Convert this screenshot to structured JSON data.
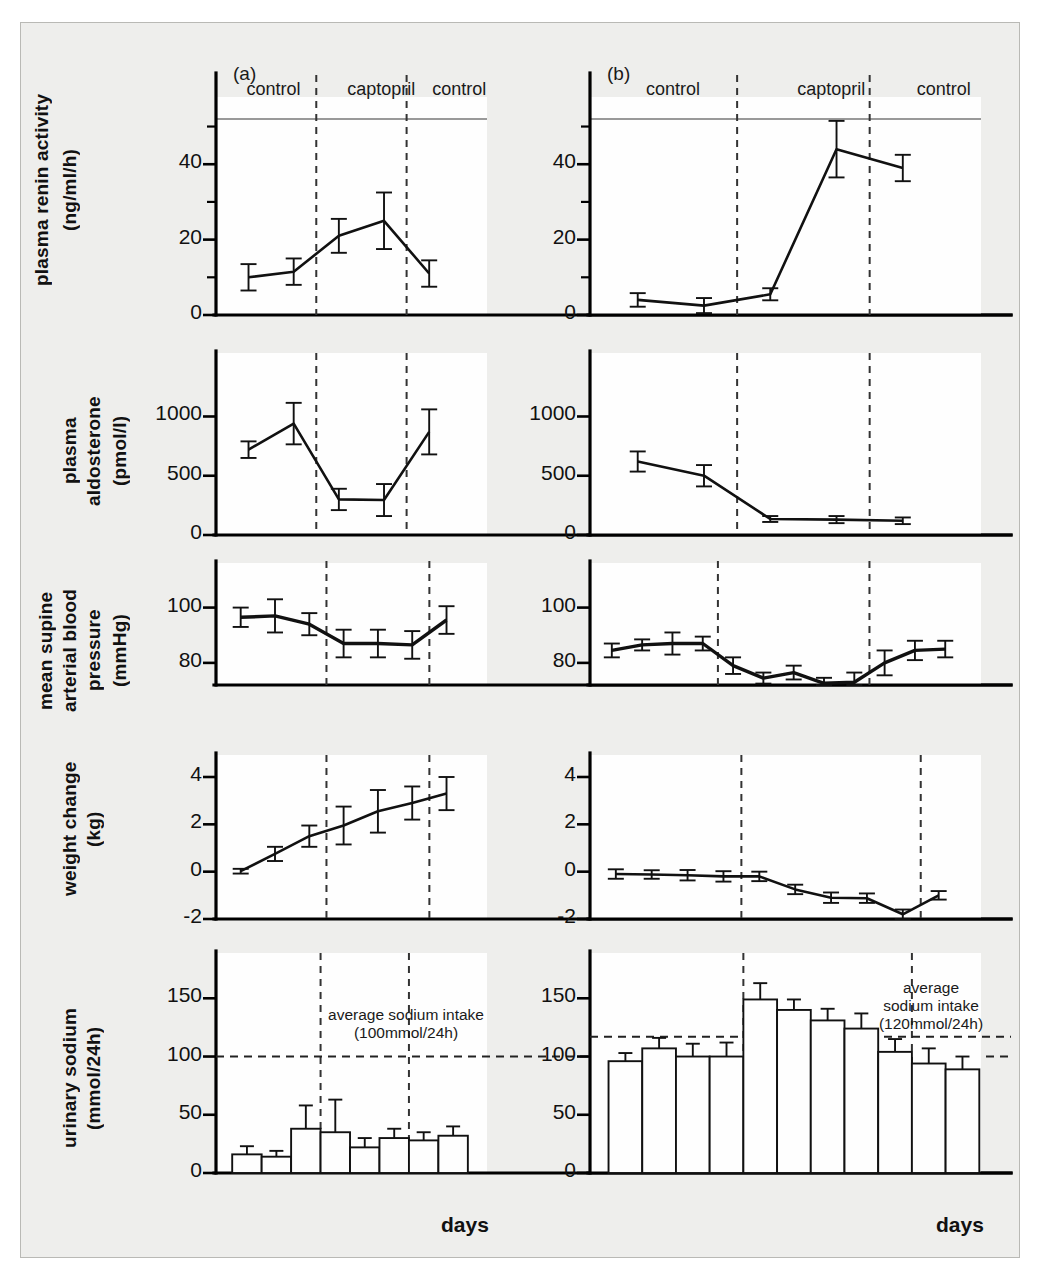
{
  "figure": {
    "panel_a_label": "(a)",
    "panel_b_label": "(b)",
    "xaxis_label_a": "days",
    "xaxis_label_b": "days",
    "phases": [
      "control",
      "captopril",
      "control"
    ]
  },
  "rows": [
    {
      "ylabel_line1": "plasma renin activity",
      "ylabel_line2": "(ng/ml/h)",
      "ticks": [
        "40",
        "20",
        "0"
      ]
    },
    {
      "ylabel_line1": "plasma",
      "ylabel_line2": "aldosterone",
      "ylabel_line3": "(pmol/l)",
      "ticks": [
        "1000",
        "500",
        "0"
      ]
    },
    {
      "ylabel_line1": "mean supine",
      "ylabel_line2": "arterial blood",
      "ylabel_line3": "pressure",
      "ylabel_line4": "(mmHg)",
      "ticks": [
        "100",
        "80"
      ]
    },
    {
      "ylabel_line1": "weight change",
      "ylabel_line2": "(kg)",
      "ticks": [
        "4",
        "2",
        "0",
        "-2"
      ]
    },
    {
      "ylabel_line1": "urinary sodium",
      "ylabel_line2": "(mmol/24h)",
      "ticks": [
        "150",
        "100",
        "50",
        "0"
      ]
    }
  ],
  "annotations": {
    "a_sodium_intake": "average sodium intake\n(100mmol/24h)",
    "a_sodium_intake_l1": "average sodium intake",
    "a_sodium_intake_l2": "(100mmol/24h)",
    "b_sodium_intake_l1": "average",
    "b_sodium_intake_l2": "sodium intake",
    "b_sodium_intake_l3": "(120mmol/24h)"
  },
  "chart_data": [
    {
      "type": "line",
      "panel": "a",
      "row": 1,
      "title": "plasma renin activity (a)",
      "ylabel": "plasma renin activity (ng/ml/h)",
      "xlabel": "days",
      "ylim": [
        0,
        52
      ],
      "yticks": [
        0,
        20,
        40
      ],
      "yticks_minor": [
        10,
        30,
        50
      ],
      "x": [
        1,
        2,
        3,
        4,
        5
      ],
      "values": [
        10,
        11.5,
        21,
        25,
        11
      ],
      "errors": [
        3.5,
        3.5,
        4.5,
        7.5,
        3.5
      ],
      "phase_boundaries": [
        2.5,
        4.5
      ],
      "phases": [
        "control",
        "captopril",
        "control"
      ]
    },
    {
      "type": "line",
      "panel": "b",
      "row": 1,
      "title": "plasma renin activity (b)",
      "ylabel": "plasma renin activity (ng/ml/h)",
      "xlabel": "days",
      "ylim": [
        0,
        52
      ],
      "yticks": [
        0,
        20,
        40
      ],
      "yticks_minor": [
        10,
        30,
        50
      ],
      "x": [
        1,
        2,
        3,
        4,
        5
      ],
      "values": [
        4,
        2.5,
        5.5,
        44,
        39
      ],
      "errors": [
        1.8,
        2,
        1.6,
        7.5,
        3.5
      ],
      "phase_boundaries": [
        2.5,
        4.5
      ],
      "phases": [
        "control",
        "captopril",
        "control"
      ]
    },
    {
      "type": "line",
      "panel": "a",
      "row": 2,
      "title": "plasma aldosterone (a)",
      "ylabel": "plasma aldosterone (pmol/l)",
      "ylim": [
        0,
        1350
      ],
      "yticks": [
        0,
        500,
        1000
      ],
      "x": [
        1,
        2,
        3,
        4,
        5
      ],
      "values": [
        720,
        940,
        300,
        295,
        870
      ],
      "errors": [
        70,
        175,
        90,
        135,
        190
      ],
      "phase_boundaries": [
        2.5,
        4.5
      ],
      "phases": [
        "control",
        "captopril",
        "control"
      ]
    },
    {
      "type": "line",
      "panel": "b",
      "row": 2,
      "title": "plasma aldosterone (b)",
      "ylabel": "plasma aldosterone (pmol/l)",
      "ylim": [
        0,
        1350
      ],
      "yticks": [
        0,
        500,
        1000
      ],
      "x": [
        1,
        2,
        3,
        4,
        5
      ],
      "values": [
        620,
        500,
        135,
        130,
        120
      ],
      "errors": [
        85,
        90,
        25,
        30,
        28
      ],
      "phase_boundaries": [
        2.5,
        4.5
      ],
      "phases": [
        "control",
        "captopril",
        "control"
      ]
    },
    {
      "type": "line",
      "panel": "a",
      "row": 3,
      "title": "mean supine arterial blood pressure (a)",
      "ylabel": "mean supine arterial blood pressure (mmHg)",
      "ylim": [
        72,
        106
      ],
      "yticks": [
        80,
        100
      ],
      "x": [
        1,
        2,
        3,
        4,
        5,
        6,
        7
      ],
      "values": [
        96.5,
        97,
        94,
        87,
        87,
        86.5,
        95.5
      ],
      "errors": [
        3.5,
        6,
        4,
        5,
        5,
        5,
        5
      ],
      "phase_boundaries": [
        3.5,
        6.5
      ],
      "phases": [
        "control",
        "captopril",
        "control"
      ]
    },
    {
      "type": "line",
      "panel": "b",
      "row": 3,
      "title": "mean supine arterial blood pressure (b)",
      "ylabel": "mean supine arterial blood pressure (mmHg)",
      "ylim": [
        72,
        106
      ],
      "yticks": [
        80,
        100
      ],
      "x": [
        1,
        2,
        3,
        4,
        5,
        6,
        7,
        8,
        9,
        10,
        11,
        12
      ],
      "values": [
        84.5,
        86.5,
        87,
        87,
        79,
        74.5,
        76.5,
        72.6,
        73,
        80,
        84.5,
        85,
        85
      ],
      "errors": [
        2.5,
        2,
        4,
        2.5,
        3,
        2,
        2.5,
        2,
        3.5,
        4.5,
        3.5,
        3
      ],
      "phase_boundaries": [
        4.5,
        9.5
      ],
      "phases": [
        "control",
        "captopril",
        "control"
      ]
    },
    {
      "type": "line",
      "panel": "a",
      "row": 4,
      "title": "weight change (a)",
      "ylabel": "weight change (kg)",
      "ylim": [
        -2,
        4
      ],
      "yticks": [
        -2,
        0,
        2,
        4
      ],
      "x": [
        1,
        2,
        3,
        4,
        5,
        6,
        7
      ],
      "values": [
        0.02,
        0.75,
        1.5,
        1.95,
        2.55,
        2.9,
        3.3
      ],
      "errors": [
        0.1,
        0.3,
        0.45,
        0.8,
        0.9,
        0.7,
        0.7
      ],
      "phase_boundaries": [
        3.5,
        6.5
      ],
      "phases": [
        "control",
        "captopril",
        "control"
      ]
    },
    {
      "type": "line",
      "panel": "b",
      "row": 4,
      "title": "weight change (b)",
      "ylabel": "weight change (kg)",
      "ylim": [
        -2,
        4
      ],
      "yticks": [
        -2,
        0,
        2,
        4
      ],
      "x": [
        1,
        2,
        3,
        4,
        5,
        6,
        7,
        8,
        9,
        10
      ],
      "values": [
        -0.1,
        -0.12,
        -0.15,
        -0.2,
        -0.2,
        -0.75,
        -1.1,
        -1.12,
        -1.8,
        -1.0,
        -1.05
      ],
      "errors": [
        0.2,
        0.18,
        0.22,
        0.22,
        0.2,
        0.2,
        0.22,
        0.2,
        0.2,
        0.18,
        0.18
      ],
      "phase_boundaries": [
        4.5,
        9.5
      ],
      "phases": [
        "control",
        "captopril",
        "control"
      ]
    },
    {
      "type": "bar",
      "panel": "a",
      "row": 5,
      "title": "urinary sodium (a)",
      "ylabel": "urinary sodium (mmol/24h)",
      "xlabel": "days",
      "ylim": [
        0,
        170
      ],
      "yticks": [
        0,
        50,
        100,
        150
      ],
      "categories": [
        1,
        2,
        3,
        4,
        5,
        6,
        7,
        8
      ],
      "values": [
        16,
        14,
        38,
        35,
        22,
        30,
        28,
        32
      ],
      "errors": [
        7,
        5,
        20,
        28,
        8,
        8,
        7,
        8
      ],
      "reference_line": 100,
      "reference_label": "average sodium intake (100mmol/24h)",
      "phase_boundaries": [
        3.5,
        6.5
      ],
      "phases": [
        "control",
        "captopril",
        "control"
      ]
    },
    {
      "type": "bar",
      "panel": "b",
      "row": 5,
      "title": "urinary sodium (b)",
      "ylabel": "urinary sodium (mmol/24h)",
      "xlabel": "days",
      "ylim": [
        0,
        170
      ],
      "yticks": [
        0,
        50,
        100,
        150
      ],
      "categories": [
        1,
        2,
        3,
        4,
        5,
        6,
        7,
        8,
        9,
        10,
        11
      ],
      "values": [
        96,
        107,
        100,
        100,
        149,
        140,
        131,
        124,
        104,
        94,
        89
      ],
      "errors": [
        7,
        9,
        11,
        12,
        14,
        9,
        10,
        13,
        11,
        13,
        11
      ],
      "reference_line": 117,
      "reference_label": "average sodium intake (120mmol/24h)",
      "phase_boundaries": [
        4.5,
        9.5
      ],
      "phases": [
        "control",
        "captopril",
        "control"
      ]
    }
  ]
}
